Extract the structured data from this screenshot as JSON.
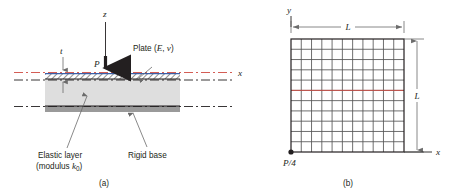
{
  "figure": {
    "panels": [
      {
        "id": "a",
        "caption": "(a)",
        "name": "side-view-panel",
        "labels": {
          "axis_z": "z",
          "axis_x": "x",
          "load_P": "P",
          "thickness_t": "t",
          "plate": "Plate (E, ν)",
          "plate_text_main": "Plate (",
          "plate_text_E": "E",
          "plate_text_comma": ", ",
          "plate_text_nu": "ν",
          "plate_text_close": ")",
          "elastic_layer_line1": "Elastic layer",
          "elastic_layer_line2_pre": "(modulus ",
          "elastic_layer_line2_k": "k",
          "elastic_layer_line2_sub": "0",
          "elastic_layer_line2_post": ")",
          "rigid_base": "Rigid base"
        }
      },
      {
        "id": "b",
        "caption": "(b)",
        "name": "plan-view-panel",
        "labels": {
          "axis_y": "y",
          "axis_x": "x",
          "dim_width_L": "L",
          "dim_height_L": "L",
          "corner_load": "P/4"
        },
        "mesh": {
          "columns": 11,
          "rows": 11,
          "highlight_row_index": 5
        }
      }
    ],
    "colors": {
      "line": "#231f20",
      "centerline_red": "#cf4b42",
      "plate_top_blue": "#3b5fa8",
      "elastic_layer_fill": "#dedede",
      "rigid_base_fill": "#9a9a9a",
      "plate_hatch": "#231f20",
      "mesh_line": "#555555",
      "mesh_highlight": "#cf4b42",
      "arrow_gray": "#6b6b6b"
    }
  }
}
